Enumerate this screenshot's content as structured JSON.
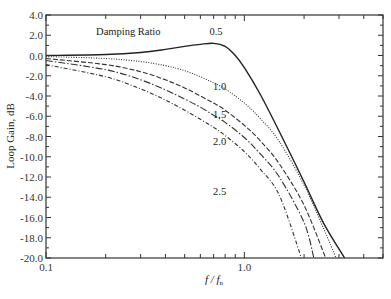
{
  "chart_data": {
    "type": "line",
    "title": "",
    "xlabel": "f / f_n",
    "xlabel_main": "f / f",
    "xlabel_sub": "n",
    "ylabel": "Loop Gain, dB",
    "xscale": "log",
    "xlim": [
      0.1,
      5.0
    ],
    "ylim": [
      -20.0,
      4.0
    ],
    "grid": false,
    "x_ticks": [
      {
        "value": 0.1,
        "label": "0.1"
      },
      {
        "value": 1.0,
        "label": "1.0"
      }
    ],
    "y_ticks": [
      {
        "value": 4.0,
        "label": "4.0"
      },
      {
        "value": 2.0,
        "label": "2.0"
      },
      {
        "value": 0.0,
        "label": "0.0"
      },
      {
        "value": -2.0,
        "label": "-2.0"
      },
      {
        "value": -4.0,
        "label": "-4.0"
      },
      {
        "value": -6.0,
        "label": "-6.0"
      },
      {
        "value": -8.0,
        "label": "-8.0"
      },
      {
        "value": -10.0,
        "label": "-10.0"
      },
      {
        "value": -12.0,
        "label": "-12.0"
      },
      {
        "value": -14.0,
        "label": "-14.0"
      },
      {
        "value": -16.0,
        "label": "-16.0"
      },
      {
        "value": -18.0,
        "label": "-18.0"
      },
      {
        "value": -20.0,
        "label": "-20.0"
      }
    ],
    "legend_title": "Damping Ratio",
    "series": [
      {
        "name": "0.5",
        "style": "solid",
        "x": [
          0.1,
          0.2,
          0.3,
          0.4,
          0.5,
          0.6,
          0.7,
          0.8,
          0.9,
          1.0,
          1.2,
          1.5,
          2.0,
          2.5,
          3.2
        ],
        "values": [
          0.0,
          0.1,
          0.3,
          0.6,
          0.9,
          1.1,
          1.2,
          0.9,
          0.0,
          -1.2,
          -3.8,
          -7.5,
          -12.5,
          -16.5,
          -20.0
        ]
      },
      {
        "name": "1.0",
        "style": "dotted",
        "x": [
          0.1,
          0.2,
          0.3,
          0.4,
          0.5,
          0.6,
          0.7,
          0.8,
          1.0,
          1.2,
          1.5,
          2.0,
          2.5,
          2.9
        ],
        "values": [
          -0.1,
          -0.3,
          -0.6,
          -1.0,
          -1.5,
          -2.1,
          -2.7,
          -3.3,
          -4.7,
          -6.2,
          -8.5,
          -12.8,
          -17.0,
          -20.0
        ]
      },
      {
        "name": "1.5",
        "style": "dashed",
        "x": [
          0.1,
          0.2,
          0.3,
          0.4,
          0.5,
          0.6,
          0.7,
          0.8,
          1.0,
          1.2,
          1.5,
          2.0,
          2.57
        ],
        "values": [
          -0.3,
          -0.9,
          -1.6,
          -2.4,
          -3.2,
          -4.0,
          -4.7,
          -5.4,
          -6.9,
          -8.4,
          -10.7,
          -14.8,
          -20.0
        ]
      },
      {
        "name": "2.0",
        "style": "long-dash-dot",
        "x": [
          0.1,
          0.2,
          0.3,
          0.4,
          0.5,
          0.6,
          0.7,
          0.8,
          1.0,
          1.2,
          1.5,
          2.0,
          2.24
        ],
        "values": [
          -0.5,
          -1.4,
          -2.4,
          -3.4,
          -4.3,
          -5.1,
          -5.9,
          -6.6,
          -8.1,
          -9.7,
          -12.0,
          -16.5,
          -20.0
        ]
      },
      {
        "name": "2.5",
        "style": "dash-dot",
        "x": [
          0.1,
          0.2,
          0.3,
          0.4,
          0.5,
          0.6,
          0.7,
          0.8,
          1.0,
          1.2,
          1.5,
          1.94
        ],
        "values": [
          -0.9,
          -2.1,
          -3.3,
          -4.4,
          -5.4,
          -6.3,
          -7.1,
          -7.9,
          -9.5,
          -11.2,
          -13.8,
          -20.0
        ]
      }
    ],
    "annotations": [
      {
        "text": "Damping Ratio",
        "x": 0.26,
        "y": 2.4
      },
      {
        "text": "0.5",
        "x": 0.72,
        "y": 2.4
      },
      {
        "text": "1.0",
        "x": 0.75,
        "y": -3.0
      },
      {
        "text": "1.5",
        "x": 0.75,
        "y": -5.8
      },
      {
        "text": "2.0",
        "x": 0.75,
        "y": -8.4
      },
      {
        "text": "2.5",
        "x": 0.75,
        "y": -13.4
      }
    ]
  }
}
